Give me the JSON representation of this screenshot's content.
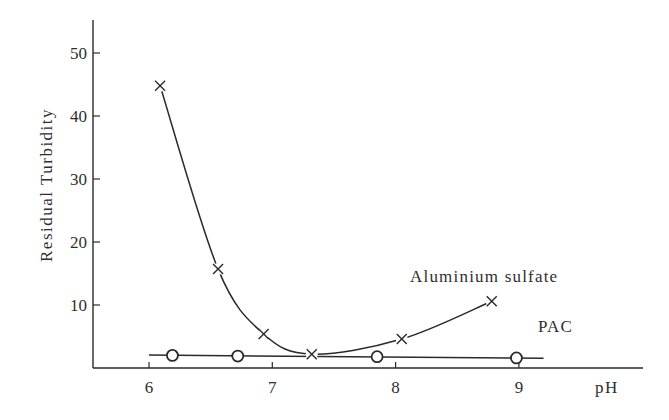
{
  "chart_data": {
    "type": "line",
    "title": "",
    "xlabel": "pH",
    "ylabel": "Residual  Turbidity",
    "xlim": [
      5.6,
      9.95
    ],
    "ylim": [
      0,
      55
    ],
    "x_ticks": [
      6,
      7,
      8,
      9
    ],
    "x_tick_labels": [
      "6",
      "7",
      "8",
      "9"
    ],
    "y_ticks": [
      10,
      20,
      30,
      40,
      50
    ],
    "y_tick_labels": [
      "10",
      "20",
      "30",
      "40",
      "50"
    ],
    "grid": false,
    "legend": "inline labels",
    "series": [
      {
        "name": "Aluminium sulfate",
        "marker": "x",
        "x": [
          6.09,
          6.56,
          6.93,
          7.32,
          8.05,
          8.78
        ],
        "values": [
          44.8,
          15.7,
          5.4,
          2.2,
          4.6,
          10.6
        ],
        "label_position": [
          410,
          282
        ]
      },
      {
        "name": "PAC",
        "marker": "o",
        "x": [
          6.19,
          6.72,
          7.85,
          8.98
        ],
        "values": [
          2.0,
          1.9,
          1.8,
          1.6
        ],
        "line_extent_x": [
          6.0,
          9.2
        ],
        "label_position": [
          538,
          332
        ]
      }
    ]
  },
  "labels": {
    "xlabel": "pH",
    "ylabel": "Residual  Turbidity",
    "series_alum": "Aluminium sulfate",
    "series_pac": "PAC"
  }
}
